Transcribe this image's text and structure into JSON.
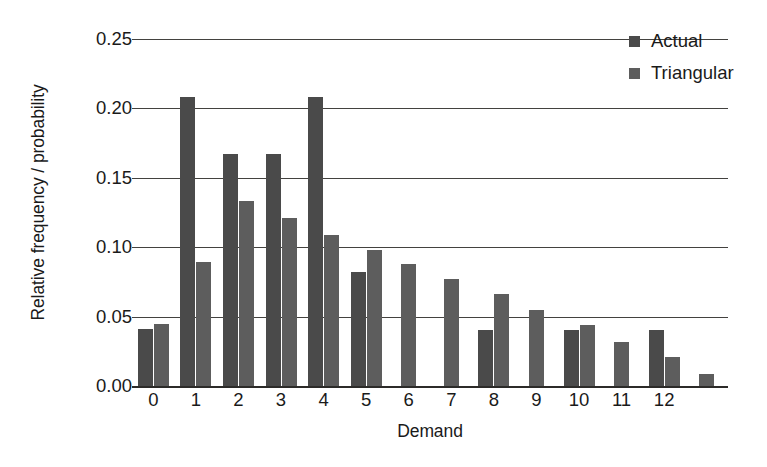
{
  "chart_data": {
    "type": "bar",
    "title": "",
    "xlabel": "Demand",
    "ylabel": "Relative frequency / probability",
    "categories": [
      "0",
      "1",
      "2",
      "3",
      "4",
      "5",
      "6",
      "7",
      "8",
      "9",
      "10",
      "11",
      "12",
      ""
    ],
    "series": [
      {
        "name": "Actual",
        "color": "#4a4a4a",
        "values": [
          0.041,
          0.208,
          0.167,
          0.167,
          0.208,
          0.082,
          null,
          null,
          0.04,
          null,
          0.04,
          null,
          0.04,
          null
        ]
      },
      {
        "name": "Triangular",
        "color": "#5d5d5d",
        "values": [
          0.045,
          0.089,
          0.133,
          0.121,
          0.109,
          0.098,
          0.088,
          0.077,
          0.066,
          0.055,
          0.044,
          0.032,
          0.021,
          0.009
        ]
      }
    ],
    "ylim": [
      0.0,
      0.25
    ],
    "yticks": [
      0.0,
      0.05,
      0.1,
      0.15,
      0.2,
      0.25
    ],
    "ytick_labels": [
      "0.00",
      "0.05",
      "0.10",
      "0.15",
      "0.20",
      "0.25"
    ],
    "xtick_labels": [
      "0",
      "1",
      "2",
      "3",
      "4",
      "5",
      "6",
      "7",
      "8",
      "9",
      "10",
      "11",
      "12"
    ],
    "grid": true,
    "legend_position": "top-right",
    "legend": [
      {
        "label": "Actual",
        "color": "#4a4a4a",
        "swatch": "square-marker"
      },
      {
        "label": "Triangular",
        "color": "#5d5d5d",
        "swatch": "square-marker"
      }
    ]
  }
}
